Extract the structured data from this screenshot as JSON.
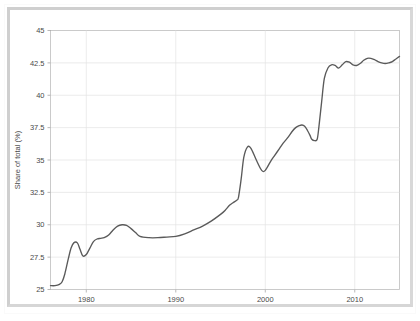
{
  "figure": {
    "border_color": "#cfcfcf",
    "background_color": "#ffffff"
  },
  "chart_data": {
    "type": "line",
    "title": "",
    "subtitle": "",
    "xlabel": "",
    "ylabel": "Share of total (%)",
    "xlim": [
      1976,
      2015
    ],
    "ylim": [
      25,
      45
    ],
    "grid": true,
    "legend": null,
    "line_color": "#5a5a5a",
    "x_ticks": [
      1980,
      1990,
      2000,
      2010
    ],
    "x_tick_labels": [
      "1980",
      "1990",
      "2000",
      "2010"
    ],
    "y_ticks": [
      25,
      27.5,
      30,
      32.5,
      35,
      37.5,
      40,
      42.5,
      45
    ],
    "y_tick_labels": [
      "25",
      "27.5",
      "30",
      "32.5",
      "35",
      "37.5",
      "40",
      "42.5",
      "45"
    ],
    "series": [
      {
        "name": "Share of total",
        "x": [
          1976,
          1976.5,
          1977,
          1977.3,
          1977.6,
          1978,
          1978.3,
          1978.6,
          1979,
          1979.3,
          1979.6,
          1980,
          1980.4,
          1980.8,
          1981.2,
          1981.6,
          1982,
          1982.5,
          1983,
          1983.5,
          1984,
          1984.5,
          1985,
          1985.5,
          1986,
          1987,
          1988,
          1989,
          1990,
          1991,
          1992,
          1993,
          1994,
          1995,
          1995.5,
          1996,
          1996.4,
          1996.8,
          1997,
          1997.3,
          1997.6,
          1998,
          1998.4,
          1999,
          1999.6,
          2000,
          2000.6,
          2001,
          2001.6,
          2002,
          2002.6,
          2003,
          2003.4,
          2003.8,
          2004.1,
          2004.4,
          2004.7,
          2005,
          2005.2,
          2005.5,
          2005.8,
          2006,
          2006.3,
          2006.6,
          2007,
          2007.4,
          2007.8,
          2008.2,
          2008.6,
          2009,
          2009.4,
          2009.8,
          2010.2,
          2010.6,
          2011,
          2011.4,
          2011.8,
          2012.2,
          2012.6,
          2013,
          2013.4,
          2013.8,
          2014.2,
          2014.6,
          2015
        ],
        "y": [
          25.3,
          25.3,
          25.4,
          25.6,
          26.2,
          27.4,
          28.2,
          28.6,
          28.6,
          28.1,
          27.6,
          27.7,
          28.2,
          28.7,
          28.9,
          28.95,
          29.0,
          29.2,
          29.6,
          29.9,
          30.0,
          29.95,
          29.7,
          29.4,
          29.1,
          29.0,
          29.0,
          29.05,
          29.1,
          29.3,
          29.6,
          29.9,
          30.3,
          30.8,
          31.1,
          31.5,
          31.7,
          31.9,
          32.1,
          33.5,
          35.2,
          36.0,
          35.9,
          35.0,
          34.2,
          34.2,
          34.9,
          35.3,
          35.9,
          36.3,
          36.8,
          37.2,
          37.5,
          37.65,
          37.7,
          37.6,
          37.3,
          36.9,
          36.6,
          36.5,
          36.6,
          37.6,
          39.5,
          41.3,
          42.1,
          42.35,
          42.3,
          42.1,
          42.35,
          42.6,
          42.55,
          42.35,
          42.3,
          42.45,
          42.7,
          42.85,
          42.85,
          42.75,
          42.6,
          42.5,
          42.45,
          42.5,
          42.6,
          42.8,
          43.0
        ]
      }
    ]
  }
}
